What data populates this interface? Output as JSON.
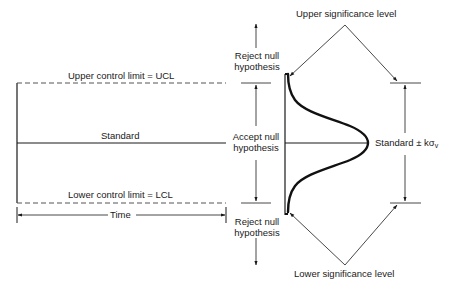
{
  "diagram": {
    "type": "control-chart-hypothesis-test",
    "control_chart": {
      "ucl_label": "Upper control limit = UCL",
      "standard_label": "Standard",
      "lcl_label": "Lower control limit = LCL",
      "time_label": "Time"
    },
    "hypothesis": {
      "reject_upper": [
        "Reject null",
        "hypothesis"
      ],
      "accept": [
        "Accept null",
        "hypothesis"
      ],
      "reject_lower": [
        "Reject null",
        "hypothesis"
      ]
    },
    "significance": {
      "upper_label": "Upper significance level",
      "lower_label": "Lower significance level",
      "range_label_prefix": "Standard ± kσ",
      "range_label_subscript": "v"
    },
    "colors": {
      "line": "#1a1a1a",
      "background": "#ffffff"
    }
  }
}
